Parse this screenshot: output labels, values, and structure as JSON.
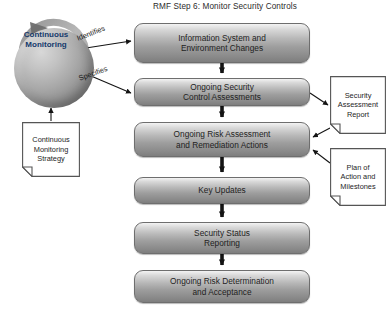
{
  "diagram": {
    "title": "RMF Step 6:  Monitor Security Controls",
    "type": "flowchart"
  },
  "hub": {
    "label_line1": "Continuous",
    "label_line2": "Monitoring",
    "icon": "circular-arrow-sphere-icon"
  },
  "edge_labels": {
    "identifies": "Identifies",
    "specifies": "Specifies"
  },
  "process_steps": [
    {
      "id": "information-system-and-environment-changes",
      "line1": "Information System and",
      "line2": "Environment Changes",
      "top": 23,
      "height": 40
    },
    {
      "id": "ongoing-security-control-assessments",
      "line1": "Ongoing Security",
      "line2": "Control Assessments",
      "top": 78,
      "height": 28
    },
    {
      "id": "ongoing-risk-assessment-and-remediation-actions",
      "line1": "Ongoing Risk Assessment",
      "line2": "and Remediation Actions",
      "top": 122,
      "height": 35
    },
    {
      "id": "key-updates",
      "line1": "Key Updates",
      "line2": "",
      "top": 177,
      "height": 27
    },
    {
      "id": "security-status-reporting",
      "line1": "Security Status",
      "line2": "Reporting",
      "top": 222,
      "height": 32
    },
    {
      "id": "ongoing-risk-determination-and-acceptance",
      "line1": "Ongoing Risk Determination",
      "line2": "and Acceptance",
      "top": 270,
      "height": 33
    }
  ],
  "artifacts": [
    {
      "id": "continuous-monitoring-strategy",
      "line1": "Continuous",
      "line2": "Monitoring",
      "line3": "Strategy",
      "left": 22,
      "top": 122,
      "width": 58,
      "height": 55
    },
    {
      "id": "security-assessment-report",
      "line1": "Security",
      "line2": "Assessment",
      "line3": "Report",
      "left": 330,
      "top": 76,
      "width": 56,
      "height": 58
    },
    {
      "id": "plan-of-action-and-milestones",
      "line1": "Plan of",
      "line2": "Action and",
      "line3": "Milestones",
      "left": 330,
      "top": 148,
      "width": 56,
      "height": 58
    }
  ],
  "colors": {
    "box_border": "#6e6e6e",
    "box_fill_top": "#f3f3f3",
    "box_fill_bottom": "#7e7e7e",
    "text": "#1e1e1e",
    "hub_label": "#15396b",
    "connector": "#111111",
    "note_border": "#555555"
  }
}
